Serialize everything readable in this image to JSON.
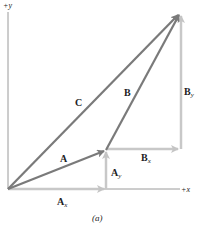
{
  "diagram": {
    "caption": "(a)",
    "axes": {
      "x_label": "+x",
      "y_label": "+y"
    },
    "vectors": {
      "A": {
        "label": "A",
        "from": [
          0,
          0
        ],
        "to": [
          98,
          39
        ]
      },
      "B": {
        "label": "B",
        "from": [
          98,
          39
        ],
        "to": [
          172,
          176
        ]
      },
      "C": {
        "label": "C",
        "from": [
          0,
          0
        ],
        "to": [
          172,
          176
        ]
      }
    },
    "components": {
      "Ax": {
        "main": "A",
        "sub": "x"
      },
      "Ay": {
        "main": "A",
        "sub": "y"
      },
      "Bx": {
        "main": "B",
        "sub": "x"
      },
      "By": {
        "main": "B",
        "sub": "y"
      }
    },
    "colors": {
      "vector": "#7a7a7a",
      "component": "#c8c8c8",
      "axis": "#9a9a9a",
      "text": "#222222"
    }
  }
}
